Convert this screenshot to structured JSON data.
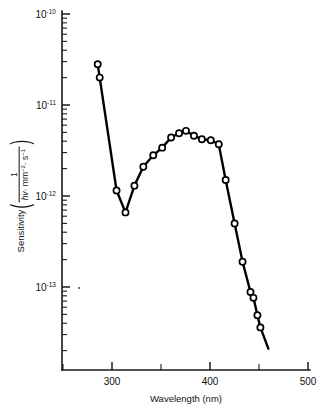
{
  "figure": {
    "background_color": "#ffffff",
    "line_color": "#000000",
    "marker_fill": "#ffffff",
    "axis_color": "#1a1a1a"
  },
  "axis_labels": {
    "x_title": "Wavelength (nm)",
    "y_title_prefix": "Sensitivity",
    "y_numerator": "1",
    "y_denominator_symbol": "hv",
    "y_denominator_rest": "· mm",
    "y_denominator_exp1": "−2",
    "y_denominator_mid": "· s",
    "y_denominator_exp2": "−1",
    "y_paren_open": "(",
    "y_paren_close": ")"
  },
  "x_ticks": {
    "major_values": [
      300,
      400,
      500
    ],
    "major_labels": [
      "300",
      "400",
      "500"
    ],
    "minor_values": [
      250,
      350,
      450
    ]
  },
  "y_ticks": {
    "major_mantissa": "10",
    "major_exponents": [
      "−10",
      "−11",
      "−12",
      "−13"
    ],
    "major_labels": [
      "10⁻¹⁰",
      "10⁻¹¹",
      "10⁻¹²",
      "10⁻¹³"
    ],
    "major_values": [
      1e-10,
      1e-11,
      1e-12,
      1e-13
    ],
    "minor_multipliers": [
      9,
      8,
      7,
      6,
      5,
      4,
      3,
      2
    ]
  },
  "chart_data": {
    "type": "line",
    "title": "",
    "xlabel": "Wavelength (nm)",
    "ylabel": "Sensitivity (1 / (hv · mm^-2 · s^-1))",
    "xscale": "linear",
    "yscale": "log",
    "xlim": [
      250,
      500
    ],
    "ylim": [
      1e-14,
      1e-10
    ],
    "grid": false,
    "legend": null,
    "markers": "open-circle",
    "series": [
      {
        "name": "Spectral sensitivity",
        "x": [
          286,
          288,
          305,
          314,
          323,
          332,
          342,
          351,
          360,
          368,
          375,
          383,
          391,
          400,
          408,
          415,
          424,
          432,
          440,
          443,
          447,
          450
        ],
        "y": [
          2.8e-11,
          2e-11,
          1.15e-12,
          6.6e-13,
          1.3e-12,
          2.1e-12,
          2.8e-12,
          3.4e-12,
          4.4e-12,
          4.9e-12,
          5.2e-12,
          4.6e-12,
          4.2e-12,
          4.1e-12,
          3.7e-12,
          1.5e-12,
          5e-13,
          1.9e-13,
          8.8e-14,
          7.6e-14,
          4.9e-14,
          3.6e-14
        ],
        "line_end_x": 458,
        "line_end_y": 2.1e-14
      }
    ],
    "annotations": [
      {
        "type": "speck",
        "x": 268,
        "y": 1.05e-13
      }
    ]
  }
}
